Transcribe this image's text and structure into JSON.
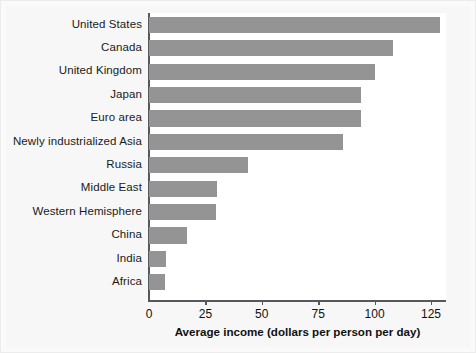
{
  "chart_data": {
    "type": "bar",
    "orientation": "horizontal",
    "title": "",
    "xlabel": "Average income (dollars per person per day)",
    "ylabel": "",
    "xlim": [
      0,
      131.6
    ],
    "xticks": [
      0,
      25,
      50,
      75,
      100,
      125
    ],
    "xtick_labels": [
      "0",
      "25",
      "50",
      "75",
      "100",
      "125"
    ],
    "grid": false,
    "legend": false,
    "bar_color": "#949494",
    "plot_background": "#ffffff",
    "figure_background": "#f7f7f7",
    "axis_color": "#55585c",
    "categories": [
      "United States",
      "Canada",
      "United Kingdom",
      "Japan",
      "Euro area",
      "Newly industrialized Asia",
      "Russia",
      "Middle East",
      "Western Hemisphere",
      "China",
      "India",
      "Africa"
    ],
    "values": [
      129,
      108,
      100,
      94,
      94,
      86,
      44,
      30,
      29.5,
      17,
      7.5,
      7
    ]
  }
}
